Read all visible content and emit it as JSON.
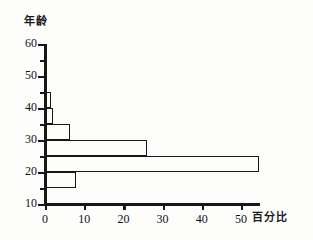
{
  "chart_data": {
    "type": "bar",
    "orientation": "horizontal",
    "title": "",
    "xlabel": "百分比",
    "ylabel": "年龄",
    "xlim": [
      0,
      55
    ],
    "ylim": [
      10,
      60
    ],
    "grid": false,
    "legend": null,
    "x_ticks": [
      {
        "value": 0,
        "label": "0"
      },
      {
        "value": 10,
        "label": "10"
      },
      {
        "value": 20,
        "label": "20"
      },
      {
        "value": 30,
        "label": "30"
      },
      {
        "value": 40,
        "label": "40"
      },
      {
        "value": 50,
        "label": "50"
      }
    ],
    "x_minor_ticks": [
      5,
      15,
      25,
      35,
      45
    ],
    "y_ticks": [
      {
        "value": 60,
        "label": "60"
      },
      {
        "value": 50,
        "label": "50"
      },
      {
        "value": 40,
        "label": "40"
      },
      {
        "value": 30,
        "label": "30"
      },
      {
        "value": 20,
        "label": "20"
      },
      {
        "value": 10,
        "label": "10"
      }
    ],
    "y_minor_ticks": [
      55,
      45,
      35,
      25,
      15
    ],
    "categories": [
      "15-20",
      "20-25",
      "25-30",
      "30-35",
      "35-40",
      "40-45"
    ],
    "values": [
      8,
      54.5,
      26,
      6.5,
      2,
      1.5
    ],
    "bars": [
      {
        "age_low": 40,
        "age_high": 45,
        "value": 1.5
      },
      {
        "age_low": 35,
        "age_high": 40,
        "value": 2
      },
      {
        "age_low": 30,
        "age_high": 35,
        "value": 6.5
      },
      {
        "age_low": 25,
        "age_high": 30,
        "value": 26
      },
      {
        "age_low": 20,
        "age_high": 25,
        "value": 54.5
      },
      {
        "age_low": 15,
        "age_high": 20,
        "value": 8
      }
    ],
    "colors": {
      "axis": "#171717",
      "bar_stroke": "#171717",
      "bar_fill": "transparent",
      "background": "#fdfdfc"
    }
  }
}
